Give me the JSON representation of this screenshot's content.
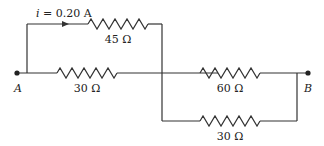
{
  "diagram": {
    "type": "circuit",
    "current_label": "i = 0.20 A",
    "current_var": "i",
    "current_value": " = 0.20 A",
    "nodes": {
      "a": "A",
      "b": "B"
    },
    "resistors": [
      {
        "id": "r45",
        "label": "45 Ω",
        "branch": "top"
      },
      {
        "id": "r30a",
        "label": "30 Ω",
        "branch": "middle-left"
      },
      {
        "id": "r60",
        "label": "60 Ω",
        "branch": "middle-right"
      },
      {
        "id": "r30b",
        "label": "30 Ω",
        "branch": "bottom"
      }
    ],
    "colors": {
      "wire": "#333333",
      "text": "#222222"
    }
  }
}
